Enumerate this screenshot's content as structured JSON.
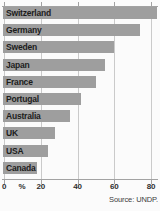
{
  "chart_data": {
    "type": "bar",
    "orientation": "horizontal",
    "title": "",
    "xlabel": "",
    "ylabel": "",
    "x_unit": "%",
    "xlim": [
      0,
      85
    ],
    "grid": true,
    "bar_color": "#9e9e9e",
    "categories": [
      "Switzerland",
      "Germany",
      "Sweden",
      "Japan",
      "France",
      "Portugal",
      "Australia",
      "UK",
      "USA",
      "Canada"
    ],
    "values": [
      83,
      74,
      60,
      55,
      50,
      42,
      36,
      28,
      24,
      18
    ],
    "x_ticks": [
      0,
      20,
      40,
      60,
      80
    ],
    "source": "Source: UNDP."
  }
}
